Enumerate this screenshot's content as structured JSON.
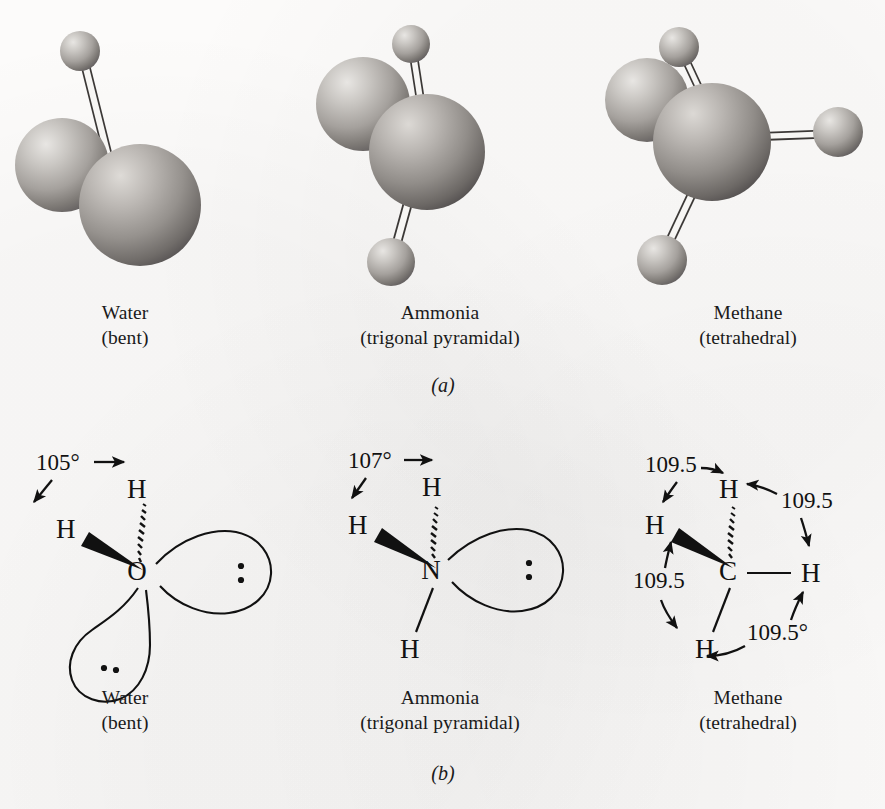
{
  "figure": {
    "background_color": "#fcfbfa",
    "ink_color": "#111111",
    "panels": [
      {
        "label": "(a)",
        "name": "panel-a-ball-and-stick"
      },
      {
        "label": "(b)",
        "name": "panel-b-orbital"
      }
    ]
  },
  "panel_a": {
    "caption_letter": "(a)",
    "molecules": [
      {
        "id": "water",
        "name": "Water",
        "shape": "(bent)"
      },
      {
        "id": "ammonia",
        "name": "Ammonia",
        "shape": "(trigonal pyramidal)"
      },
      {
        "id": "methane",
        "name": "Methane",
        "shape": "(tetrahedral)"
      }
    ]
  },
  "panel_b": {
    "caption_letter": "(b)",
    "molecules": [
      {
        "id": "water",
        "name": "Water",
        "shape": "(bent)",
        "center_atom": "O",
        "hydrogens": [
          "H",
          "H"
        ],
        "bond_angle": "105°",
        "angle_labels": [
          "105°"
        ],
        "lone_pairs": 2
      },
      {
        "id": "ammonia",
        "name": "Ammonia",
        "shape": "(trigonal pyramidal)",
        "center_atom": "N",
        "hydrogens": [
          "H",
          "H",
          "H"
        ],
        "bond_angle": "107°",
        "angle_labels": [
          "107°"
        ],
        "lone_pairs": 1
      },
      {
        "id": "methane",
        "name": "Methane",
        "shape": "(tetrahedral)",
        "center_atom": "C",
        "hydrogens": [
          "H",
          "H",
          "H",
          "H"
        ],
        "bond_angle": "109.5°",
        "angle_labels": [
          "109.5",
          "109.5",
          "109.5",
          "109.5°"
        ],
        "lone_pairs": 0
      }
    ]
  }
}
